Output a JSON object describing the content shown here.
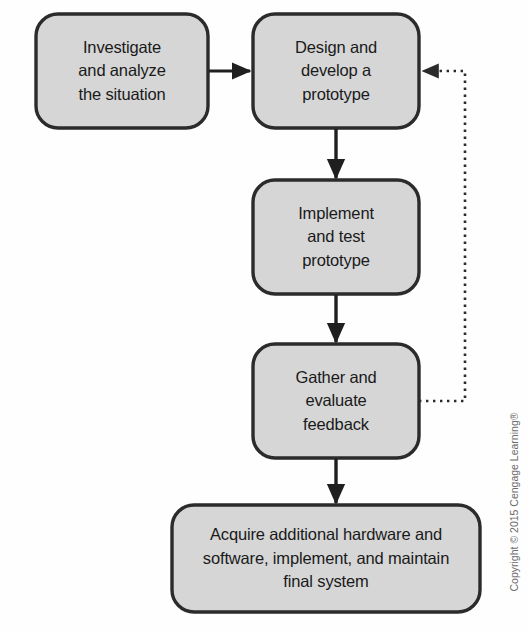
{
  "diagram": {
    "background_color": "#fefefe",
    "node_fill": "#d6d6d6",
    "node_stroke": "#2b2b2b",
    "connector_color": "#1f1f1f",
    "feedback_color": "#3a3a3a",
    "text_color": "#1a1a1a",
    "nodes": [
      {
        "id": "investigate",
        "label": "Investigate\nand analyze\nthe situation",
        "x": 36,
        "y": 14,
        "width": 172,
        "height": 114
      },
      {
        "id": "design",
        "label": "Design and\ndevelop a\nprototype",
        "x": 253,
        "y": 14,
        "width": 166,
        "height": 114
      },
      {
        "id": "implement",
        "label": "Implement\nand test\nprototype",
        "x": 253,
        "y": 180,
        "width": 166,
        "height": 114
      },
      {
        "id": "gather",
        "label": "Gather and\nevaluate\nfeedback",
        "x": 253,
        "y": 344,
        "width": 166,
        "height": 114
      },
      {
        "id": "acquire",
        "label": "Acquire additional hardware and\nsoftware, implement, and maintain\nfinal system",
        "x": 172,
        "y": 505,
        "width": 308,
        "height": 107
      }
    ],
    "connectors": [
      {
        "id": "investigate-to-design",
        "from": "investigate",
        "to": "design",
        "style": "solid",
        "direction": "right",
        "arrowhead": true
      },
      {
        "id": "design-to-implement",
        "from": "design",
        "to": "implement",
        "style": "solid",
        "direction": "down",
        "arrowhead": true
      },
      {
        "id": "implement-to-gather",
        "from": "implement",
        "to": "gather",
        "style": "solid",
        "direction": "down",
        "arrowhead": true
      },
      {
        "id": "gather-to-acquire",
        "from": "gather",
        "to": "acquire",
        "style": "solid",
        "direction": "down",
        "arrowhead": true
      },
      {
        "id": "gather-feedback-to-design",
        "from": "gather",
        "to": "design",
        "style": "dotted",
        "direction": "left",
        "arrowhead": true
      }
    ]
  },
  "footer": {
    "copyright": "Copyright © 2015 Cengage Learning®"
  }
}
